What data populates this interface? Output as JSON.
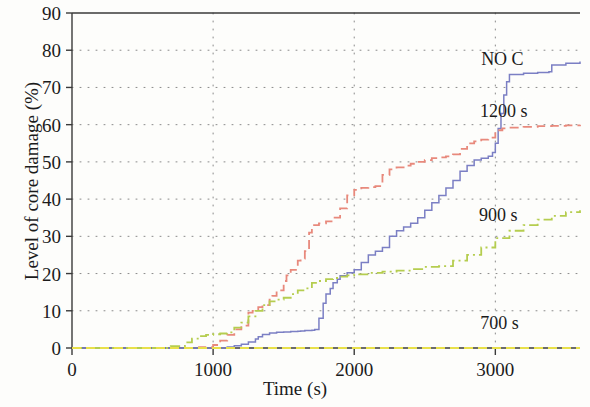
{
  "chart_data": {
    "type": "line",
    "title": "",
    "xlabel": "Time (s)",
    "ylabel": "Level of core damage (%)",
    "xlim": [
      0,
      3600
    ],
    "ylim": [
      0,
      90
    ],
    "xticks": [
      0,
      1000,
      2000,
      3000
    ],
    "yticks": [
      0,
      10,
      20,
      30,
      40,
      50,
      60,
      70,
      80,
      90
    ],
    "grid": true,
    "grid_style": "dotted",
    "legend_position": "inline-annotations",
    "series": [
      {
        "name": "NO C",
        "label": "NO C",
        "color": "#7b7fc4",
        "style": "solid",
        "label_x": 3050,
        "label_y": 76,
        "x": [
          0,
          400,
          500,
          600,
          700,
          800,
          900,
          1000,
          1100,
          1150,
          1200,
          1250,
          1300,
          1320,
          1350,
          1400,
          1450,
          1500,
          1550,
          1600,
          1620,
          1650,
          1700,
          1720,
          1750,
          1780,
          1800,
          1830,
          1850,
          1880,
          1900,
          1950,
          2000,
          2050,
          2100,
          2150,
          2200,
          2250,
          2300,
          2350,
          2400,
          2450,
          2500,
          2550,
          2600,
          2650,
          2700,
          2750,
          2800,
          2850,
          2900,
          2950,
          2980,
          3000,
          3020,
          3040,
          3060,
          3080,
          3100,
          3200,
          3300,
          3380,
          3400,
          3500,
          3600
        ],
        "y": [
          0,
          0,
          0,
          0,
          0,
          0,
          0,
          0,
          0.3,
          0.6,
          1.0,
          1.6,
          2.4,
          3.0,
          3.6,
          4.0,
          4.2,
          4.3,
          4.4,
          4.5,
          4.6,
          4.7,
          4.8,
          5.0,
          8.0,
          12.0,
          14.5,
          16.0,
          17.5,
          18.5,
          19.4,
          20.2,
          21.0,
          23.0,
          25.0,
          26.0,
          27.0,
          30.0,
          31.5,
          32.5,
          33.5,
          35.0,
          37.0,
          39.0,
          41.0,
          43.0,
          45.0,
          47.5,
          49.0,
          50.5,
          51.0,
          51.5,
          52.5,
          55.0,
          59.0,
          63.0,
          68.0,
          71.5,
          73.5,
          73.8,
          74.0,
          74.2,
          76.0,
          76.5,
          77.0
        ]
      },
      {
        "name": "1200 s",
        "label": "1200 s",
        "color": "#e8897c",
        "style": "dashed",
        "label_x": 3060,
        "label_y": 62,
        "x": [
          0,
          400,
          600,
          800,
          900,
          1000,
          1050,
          1100,
          1150,
          1200,
          1250,
          1280,
          1300,
          1320,
          1350,
          1400,
          1420,
          1450,
          1500,
          1520,
          1550,
          1600,
          1620,
          1650,
          1680,
          1700,
          1750,
          1800,
          1850,
          1900,
          1950,
          2000,
          2050,
          2100,
          2150,
          2200,
          2250,
          2300,
          2350,
          2400,
          2450,
          2500,
          2550,
          2600,
          2650,
          2700,
          2750,
          2800,
          2850,
          2900,
          2950,
          3000,
          3050,
          3100,
          3200,
          3300,
          3400,
          3500,
          3600
        ],
        "y": [
          0,
          0,
          0,
          0,
          0.2,
          0.8,
          2.0,
          3.5,
          5.0,
          6.0,
          9.5,
          10.0,
          10.2,
          11.0,
          11.5,
          13.0,
          14.0,
          15.5,
          18.0,
          19.5,
          21.0,
          23.5,
          24.0,
          26.0,
          31.0,
          33.0,
          33.5,
          34.0,
          35.0,
          37.5,
          41.0,
          42.5,
          43.0,
          43.2,
          43.5,
          46.5,
          48.0,
          48.5,
          49.0,
          49.5,
          50.0,
          50.5,
          51.0,
          51.2,
          51.5,
          52.0,
          53.5,
          55.0,
          55.5,
          56.0,
          56.5,
          58.5,
          59.0,
          59.2,
          59.4,
          59.6,
          59.7,
          59.8,
          60.0
        ]
      },
      {
        "name": "900 s",
        "label": "900 s",
        "color": "#b5cd4f",
        "style": "dashdot",
        "label_x": 3020,
        "label_y": 34,
        "x": [
          0,
          400,
          600,
          700,
          800,
          850,
          900,
          950,
          1000,
          1050,
          1100,
          1150,
          1200,
          1250,
          1300,
          1350,
          1400,
          1450,
          1500,
          1550,
          1600,
          1650,
          1700,
          1750,
          1800,
          1850,
          1900,
          1950,
          2000,
          2100,
          2200,
          2300,
          2400,
          2500,
          2600,
          2700,
          2800,
          2900,
          3000,
          3100,
          3200,
          3300,
          3400,
          3500,
          3600
        ],
        "y": [
          0,
          0,
          0,
          0.5,
          1.5,
          2.5,
          3.2,
          3.5,
          3.7,
          3.9,
          4.2,
          5.5,
          6.8,
          8.5,
          10.0,
          11.5,
          12.5,
          13.0,
          13.5,
          14.5,
          15.5,
          16.0,
          17.5,
          18.0,
          18.5,
          18.8,
          19.2,
          19.5,
          19.8,
          20.2,
          20.5,
          20.8,
          21.2,
          21.8,
          22.0,
          23.5,
          25.0,
          27.0,
          29.5,
          31.5,
          33.0,
          34.5,
          35.5,
          36.5,
          37.0
        ]
      },
      {
        "name": "700 s",
        "label": "700 s",
        "color": "#e8e04a",
        "style": "dashed",
        "label_x": 3030,
        "label_y": 5,
        "x": [
          0,
          500,
          1000,
          1500,
          2000,
          2500,
          3000,
          3600
        ],
        "y": [
          0,
          0,
          0,
          0,
          0,
          0,
          0,
          0
        ]
      }
    ]
  }
}
